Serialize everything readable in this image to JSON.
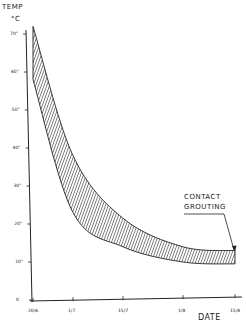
{
  "chart_data": {
    "type": "area",
    "title": "",
    "ylabel_line1": "TEMP",
    "ylabel_line2": "°C",
    "xlabel": "DATE",
    "ylim": [
      0,
      75
    ],
    "yticks": [
      0,
      10,
      20,
      30,
      40,
      50,
      60,
      70
    ],
    "ytick_labels": [
      "0",
      "10°",
      "20°",
      "30°",
      "40°",
      "50°",
      "60°",
      "70°"
    ],
    "categories": [
      "20/6",
      "1/7",
      "15/7",
      "1/8",
      "15/8"
    ],
    "series": [
      {
        "name": "upper bound",
        "values": [
          72,
          38,
          21.5,
          14,
          13
        ]
      },
      {
        "name": "lower bound",
        "values": [
          58,
          23,
          14,
          10,
          9.5
        ]
      }
    ],
    "fill": "hatched band between upper and lower bound",
    "annotations": [
      {
        "text_line1": "CONTACT",
        "text_line2": "GROUTING",
        "points_to": "15/8"
      }
    ],
    "grid": false,
    "legend": "none"
  }
}
